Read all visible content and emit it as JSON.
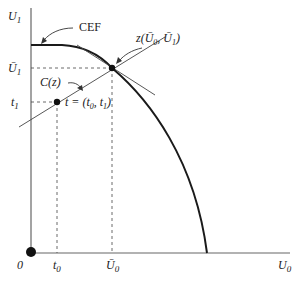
{
  "axes": {
    "y_label": "U",
    "y_sub": "1",
    "x_label": "U",
    "x_sub": "0",
    "origin_label": "0"
  },
  "ticks": {
    "y": [
      {
        "label": "Ū",
        "sub": "1"
      },
      {
        "label": "t",
        "sub": "1"
      }
    ],
    "x": [
      {
        "label": "t",
        "sub": "0"
      },
      {
        "label": "Ū",
        "sub": "0"
      }
    ]
  },
  "annotations": {
    "cef": "CEF",
    "cz": "C(z)",
    "z_point": "z(Ū",
    "z_point_sub0": "0",
    "z_point_mid": ", Ū",
    "z_point_sub1": "1",
    "z_point_end": ")",
    "t_point": "t = (t",
    "t_point_sub0": "0",
    "t_point_mid": ", t",
    "t_point_sub1": "1",
    "t_point_end": ")"
  },
  "colors": {
    "curve": "#1a1a1a",
    "axis": "#555555",
    "line": "#333333",
    "dashed": "#444444"
  }
}
